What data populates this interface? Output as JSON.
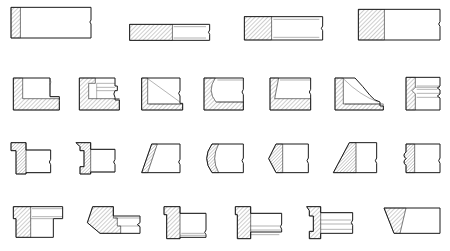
{
  "sheet": {
    "title": "Molding Profile Cross-Sections",
    "description": "Technical line-drawing catalog of architectural trim and molding cross-section profiles",
    "drawing_type": "sectional-elevation",
    "background_color": "#ffffff",
    "line_color": "#1a1a1a",
    "hatch_color": "#1a1a1a",
    "hatch_angle_degrees": 45,
    "hatch_spacing_px": 3,
    "line_width_px": 1,
    "row_count": 4,
    "profile_count": 26,
    "width_px": 450,
    "height_px": 251
  },
  "rows": [
    {
      "row_index": 1,
      "row_name": "flat-stock-bars",
      "profile_count": 4,
      "profiles": [
        {
          "id": "r1c1",
          "name": "tall-flat-bar-narrow-hatch",
          "hatch_region": "left-narrow-strip",
          "break_line": "right-edge-wavy",
          "x": 33,
          "y": 22,
          "w": 240,
          "h": 92
        },
        {
          "id": "r1c2",
          "name": "thin-flat-bar-half-hatch",
          "hatch_region": "left-half",
          "break_line": "right-edge-wavy",
          "x": 389,
          "y": 73,
          "w": 240,
          "h": 48
        },
        {
          "id": "r1c3",
          "name": "medium-flat-bar-left-hatch",
          "hatch_region": "left-third",
          "break_line": "right-edge-wavy",
          "x": 733,
          "y": 50,
          "w": 235,
          "h": 70
        },
        {
          "id": "r1c4",
          "name": "wide-flat-bar-left-hatch",
          "hatch_region": "left-quarter",
          "break_line": "right-edge-wavy",
          "x": 1075,
          "y": 28,
          "w": 245,
          "h": 92
        }
      ]
    },
    {
      "row_index": 2,
      "row_name": "rebated-and-chamfered-profiles",
      "profile_count": 7,
      "profiles": [
        {
          "id": "r2c1",
          "name": "l-shaped-rebate-profile",
          "hatch_region": "left-edge-and-bottom-rail",
          "features": [
            "square-rebate",
            "bottom-shelf"
          ]
        },
        {
          "id": "r2c2",
          "name": "stepped-rebate-with-groove",
          "hatch_region": "left-edge-and-bottom-rail",
          "features": [
            "top-step",
            "center-groove",
            "bottom-shelf"
          ]
        },
        {
          "id": "r2c3",
          "name": "diagonal-splay-profile",
          "hatch_region": "left-triangular-wedge",
          "features": [
            "angled-face",
            "bottom-shelf"
          ]
        },
        {
          "id": "r2c4",
          "name": "concave-cove-profile",
          "hatch_region": "left-curved-wedge",
          "features": [
            "cove-curve",
            "bottom-shelf"
          ]
        },
        {
          "id": "r2c5",
          "name": "shallow-bevel-profile",
          "hatch_region": "left-narrow-wedge",
          "features": [
            "bevel-face",
            "lower-band"
          ]
        },
        {
          "id": "r2c6",
          "name": "ogee-sweep-profile",
          "hatch_region": "left-large-wedge",
          "features": [
            "s-curve-sweep",
            "bottom-shelf"
          ]
        },
        {
          "id": "r2c7",
          "name": "multi-groove-molding",
          "hatch_region": "left-edge-strip",
          "features": [
            "three-horizontal-grooves",
            "stacked-bands"
          ]
        }
      ]
    },
    {
      "row_index": 3,
      "row_name": "narrow-edge-profiles",
      "profile_count": 7,
      "profiles": [
        {
          "id": "r3c1",
          "name": "t-notch-edge-profile",
          "hatch_region": "left-vertical-strip",
          "features": [
            "top-notch",
            "square-body"
          ]
        },
        {
          "id": "r3c2",
          "name": "double-notch-edge-profile",
          "hatch_region": "left-vertical-strip",
          "features": [
            "top-notch",
            "bottom-notch"
          ]
        },
        {
          "id": "r3c3",
          "name": "angled-chamfer-edge",
          "hatch_region": "left-slanted-strip",
          "features": [
            "chamfered-left-edge"
          ]
        },
        {
          "id": "r3c4",
          "name": "rounded-bullnose-edge",
          "hatch_region": "left-curved-strip",
          "features": [
            "bullnose-curve"
          ]
        },
        {
          "id": "r3c5",
          "name": "notched-vee-edge",
          "hatch_region": "left-vee-strip",
          "features": [
            "vee-notch-left"
          ]
        },
        {
          "id": "r3c6",
          "name": "triangular-splay-edge",
          "hatch_region": "left-triangle",
          "features": [
            "steep-splay",
            "flat-foot"
          ]
        },
        {
          "id": "r3c7",
          "name": "wavy-scalloped-edge",
          "hatch_region": "left-scalloped-strip",
          "features": [
            "scallop-profile"
          ]
        }
      ]
    },
    {
      "row_index": 4,
      "row_name": "bracket-and-capital-profiles",
      "profile_count": 6,
      "profiles": [
        {
          "id": "r4c1",
          "name": "t-head-bracket-profile",
          "hatch_region": "left-vertical-stem",
          "features": [
            "overhanging-cap",
            "vertical-stem"
          ]
        },
        {
          "id": "r4c2",
          "name": "angled-corbel-profile",
          "hatch_region": "left-splayed-block",
          "features": [
            "raked-face",
            "stepped-shelves"
          ]
        },
        {
          "id": "r4c3",
          "name": "l-bracket-with-shelf",
          "hatch_region": "left-vertical-strip",
          "features": [
            "top-notch",
            "bottom-shelf",
            "tapered-face"
          ]
        },
        {
          "id": "r4c4",
          "name": "double-shelf-bracket",
          "hatch_region": "left-vertical-strip",
          "features": [
            "two-bottom-shelves",
            "tapered-right"
          ]
        },
        {
          "id": "r4c5",
          "name": "triple-band-bracket",
          "hatch_region": "left-notched-strip",
          "features": [
            "three-stacked-bands",
            "notched-spine"
          ]
        },
        {
          "id": "r4c6",
          "name": "tapered-wedge-block",
          "hatch_region": "left-tapered-wedge",
          "features": [
            "trapezoid-body",
            "sloped-top"
          ]
        }
      ]
    }
  ]
}
